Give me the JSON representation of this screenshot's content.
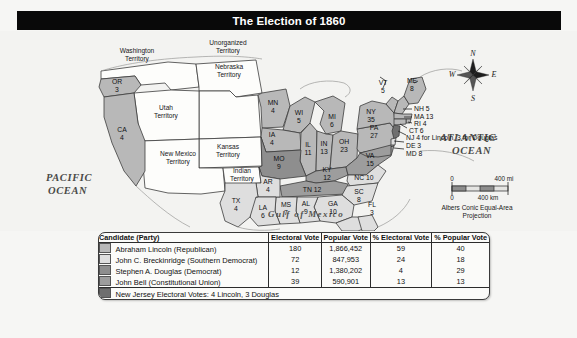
{
  "title": "The Election of 1860",
  "map": {
    "ocean_labels": [
      {
        "name": "pacific",
        "line1": "PACIFIC",
        "line2": "OCEAN"
      },
      {
        "name": "atlantic",
        "line1": "ATLANTIC",
        "line2": "OCEAN"
      }
    ],
    "gulf_label": "Gulf of Mexico",
    "territories": [
      {
        "name": "washington-territory",
        "line1": "Washington",
        "line2": "Territory"
      },
      {
        "name": "unorganized-territory",
        "line1": "Unorganized",
        "line2": "Territory"
      },
      {
        "name": "nebraska-territory",
        "line1": "Nebraska",
        "line2": "Territory"
      },
      {
        "name": "utah-territory",
        "line1": "Utah",
        "line2": "Territory"
      },
      {
        "name": "kansas-territory",
        "line1": "Kansas",
        "line2": "Territory"
      },
      {
        "name": "new-mexico-territory",
        "line1": "New Mexico",
        "line2": "Territory"
      },
      {
        "name": "indian-territory",
        "line1": "Indian",
        "line2": "Territory"
      }
    ],
    "states": [
      {
        "abbr": "OR",
        "votes": "3",
        "winner": "lincoln"
      },
      {
        "abbr": "CA",
        "votes": "4",
        "winner": "lincoln"
      },
      {
        "abbr": "MN",
        "votes": "4",
        "winner": "lincoln"
      },
      {
        "abbr": "WI",
        "votes": "5",
        "winner": "lincoln"
      },
      {
        "abbr": "IA",
        "votes": "4",
        "winner": "lincoln"
      },
      {
        "abbr": "MI",
        "votes": "6",
        "winner": "lincoln"
      },
      {
        "abbr": "IL",
        "votes": "11",
        "winner": "lincoln"
      },
      {
        "abbr": "IN",
        "votes": "13",
        "winner": "lincoln"
      },
      {
        "abbr": "OH",
        "votes": "23",
        "winner": "lincoln"
      },
      {
        "abbr": "PA",
        "votes": "27",
        "winner": "lincoln"
      },
      {
        "abbr": "NY",
        "votes": "35",
        "winner": "lincoln"
      },
      {
        "abbr": "VT",
        "votes": "5",
        "winner": "lincoln"
      },
      {
        "abbr": "ME",
        "votes": "8",
        "winner": "lincoln"
      },
      {
        "abbr": "MO",
        "votes": "9",
        "winner": "douglas"
      },
      {
        "abbr": "KY",
        "votes": "12",
        "winner": "bell"
      },
      {
        "abbr": "TN",
        "votes": "12",
        "winner": "bell"
      },
      {
        "abbr": "VA",
        "votes": "15",
        "winner": "bell"
      },
      {
        "abbr": "NC",
        "votes": "10",
        "winner": "breckinridge"
      },
      {
        "abbr": "SC",
        "votes": "8",
        "winner": "breckinridge"
      },
      {
        "abbr": "GA",
        "votes": "10",
        "winner": "breckinridge"
      },
      {
        "abbr": "AL",
        "votes": "9",
        "winner": "breckinridge"
      },
      {
        "abbr": "MS",
        "votes": "7",
        "winner": "breckinridge"
      },
      {
        "abbr": "LA",
        "votes": "6",
        "winner": "breckinridge"
      },
      {
        "abbr": "AR",
        "votes": "4",
        "winner": "breckinridge"
      },
      {
        "abbr": "TX",
        "votes": "4",
        "winner": "breckinridge"
      },
      {
        "abbr": "FL",
        "votes": "3",
        "winner": "breckinridge"
      }
    ],
    "leader_labels": [
      {
        "name": "nh",
        "text": "NH 5"
      },
      {
        "name": "ma",
        "text": "MA 13"
      },
      {
        "name": "ri",
        "text": "RI 4"
      },
      {
        "name": "ct",
        "text": "CT 6"
      },
      {
        "name": "nj",
        "text": "NJ 4 for Lincoln, 3 for Douglas"
      },
      {
        "name": "de",
        "text": "DE 3"
      },
      {
        "name": "md",
        "text": "MD 8"
      }
    ],
    "compass": {
      "north": "N",
      "east": "E",
      "south": "S",
      "west": "W"
    },
    "scale": {
      "mi_zero": "0",
      "mi_max": "400 mi",
      "km_zero": "0",
      "km_max": "400 km",
      "projection_line1": "Albers Conic Equal-Area",
      "projection_line2": "Projection"
    }
  },
  "legend": {
    "headers": [
      "Candidate (Party)",
      "Electoral Vote",
      "Popular Vote",
      "% Electoral Vote",
      "% Popular Vote"
    ],
    "rows": [
      {
        "swatch": "#b8b8b8",
        "candidate": "Abraham Lincoln (Republican)",
        "electoral": "180",
        "popular": "1,866,452",
        "pct_electoral": "59",
        "pct_popular": "40"
      },
      {
        "swatch": "#dedede",
        "candidate": "John C. Breckinridge (Southern Democrat)",
        "electoral": "72",
        "popular": "847,953",
        "pct_electoral": "24",
        "pct_popular": "18"
      },
      {
        "swatch": "#8e8e8e",
        "candidate": "Stephen A. Douglas (Democrat)",
        "electoral": "12",
        "popular": "1,380,202",
        "pct_electoral": "4",
        "pct_popular": "29"
      },
      {
        "swatch": "#9d9d9d",
        "candidate": "John Bell (Constitutional Union)",
        "electoral": "39",
        "popular": "590,901",
        "pct_electoral": "13",
        "pct_popular": "13"
      }
    ],
    "footer": {
      "swatch": "#6f6f6f",
      "text": "New Jersey Electoral Votes: 4 Lincoln, 3 Douglas"
    }
  },
  "colors": {
    "title_bar": "#090909",
    "lincoln": "#b8b8b8",
    "breckinridge": "#dedede",
    "douglas": "#8e8e8e",
    "bell": "#9d9d9d",
    "territory": "#fdfdfb",
    "ocean": "#f1f1ef",
    "outline": "#3c3c3c"
  }
}
